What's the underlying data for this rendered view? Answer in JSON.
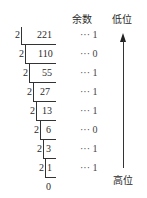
{
  "headers": {
    "remainder": "余数",
    "low_bit": "低位",
    "high_bit": "高位"
  },
  "divisor": "2",
  "rows": [
    {
      "dividend": "221",
      "remainder": "··· 1"
    },
    {
      "dividend": "110",
      "remainder": "··· 0"
    },
    {
      "dividend": "55",
      "remainder": "··· 1"
    },
    {
      "dividend": "27",
      "remainder": "··· 1"
    },
    {
      "dividend": "13",
      "remainder": "··· 1"
    },
    {
      "dividend": "6",
      "remainder": "··· 0"
    },
    {
      "dividend": "3",
      "remainder": "··· 1"
    },
    {
      "dividend": "1",
      "remainder": "··· 1"
    }
  ],
  "final_quotient": "0",
  "arrow": {
    "direction": "up",
    "from": "高位",
    "to": "低位"
  }
}
